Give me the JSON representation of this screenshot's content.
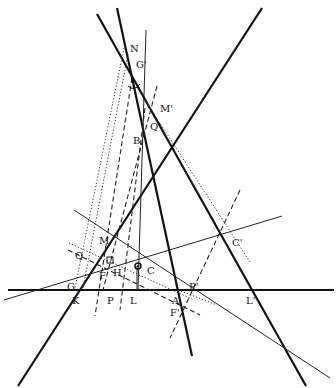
{
  "diagram": {
    "kind": "projective geometry construction",
    "points": [
      {
        "id": "N",
        "label": "N",
        "x": 127,
        "y": 48,
        "lx": 130,
        "ly": 48
      },
      {
        "id": "Gp",
        "label": "G'",
        "x": 134,
        "y": 78,
        "lx": 136,
        "ly": 64
      },
      {
        "id": "Mp",
        "label": "M'",
        "x": 156,
        "y": 105,
        "lx": 160,
        "ly": 108
      },
      {
        "id": "Qp",
        "label": "Q'",
        "x": 145,
        "y": 116,
        "lx": 150,
        "ly": 126
      },
      {
        "id": "B",
        "label": "B",
        "x": 144,
        "y": 138,
        "lx": 133,
        "ly": 140
      },
      {
        "id": "M",
        "label": "M",
        "x": 96,
        "y": 237,
        "lx": 99,
        "ly": 240
      },
      {
        "id": "Q",
        "label": "Q",
        "x": 88,
        "y": 256,
        "lx": 75,
        "ly": 255
      },
      {
        "id": "H",
        "label": "H",
        "x": 112,
        "y": 261,
        "lx": 113,
        "ly": 272
      },
      {
        "id": "C",
        "label": "C",
        "x": 138,
        "y": 266,
        "lx": 147,
        "ly": 270
      },
      {
        "id": "F",
        "label": "F",
        "x": 107,
        "y": 278,
        "lx": 99,
        "ly": 275
      },
      {
        "id": "G",
        "label": "G",
        "x": 78,
        "y": 281,
        "lx": 67,
        "ly": 286
      },
      {
        "id": "Cp",
        "label": "C'",
        "x": 228,
        "y": 236,
        "lx": 232,
        "ly": 242
      },
      {
        "id": "K",
        "label": "K",
        "x": 71,
        "y": 290,
        "lx": 72,
        "ly": 300
      },
      {
        "id": "P",
        "label": "P",
        "x": 107,
        "y": 290,
        "lx": 107,
        "ly": 300
      },
      {
        "id": "L",
        "label": "L",
        "x": 137,
        "y": 290,
        "lx": 130,
        "ly": 300
      },
      {
        "id": "A",
        "label": "A",
        "x": 178,
        "y": 290,
        "lx": 172,
        "ly": 300
      },
      {
        "id": "Pp",
        "label": "P'",
        "x": 190,
        "y": 286,
        "lx": 189,
        "ly": 286
      },
      {
        "id": "Fp",
        "label": "F'",
        "x": 181,
        "y": 307,
        "lx": 170,
        "ly": 312
      },
      {
        "id": "Lp",
        "label": "L'",
        "x": 256,
        "y": 290,
        "lx": 246,
        "ly": 300
      }
    ],
    "lines": {
      "thick": [
        {
          "x1": 117,
          "y1": 8,
          "x2": 192,
          "y2": 356
        },
        {
          "x1": 97,
          "y1": 14,
          "x2": 306,
          "y2": 386
        },
        {
          "x1": 262,
          "y1": 8,
          "x2": 18,
          "y2": 386
        },
        {
          "x1": 8,
          "y1": 290,
          "x2": 334,
          "y2": 290
        }
      ],
      "thin": [
        {
          "x1": 146,
          "y1": 30,
          "x2": 138,
          "y2": 290
        },
        {
          "x1": 4,
          "y1": 300,
          "x2": 282,
          "y2": 216
        },
        {
          "x1": 74,
          "y1": 210,
          "x2": 330,
          "y2": 378
        },
        {
          "x1": 137,
          "y1": 266,
          "x2": 137,
          "y2": 290
        }
      ],
      "dashed": [
        {
          "x1": 132,
          "y1": 78,
          "x2": 95,
          "y2": 316
        },
        {
          "x1": 145,
          "y1": 108,
          "x2": 120,
          "y2": 310
        },
        {
          "x1": 240,
          "y1": 190,
          "x2": 170,
          "y2": 338
        },
        {
          "x1": 68,
          "y1": 250,
          "x2": 200,
          "y2": 315
        },
        {
          "x1": 157,
          "y1": 86,
          "x2": 103,
          "y2": 290
        }
      ],
      "dotted": [
        {
          "x1": 124,
          "y1": 48,
          "x2": 75,
          "y2": 288
        },
        {
          "x1": 128,
          "y1": 54,
          "x2": 83,
          "y2": 288
        },
        {
          "x1": 69,
          "y1": 243,
          "x2": 194,
          "y2": 300
        },
        {
          "x1": 145,
          "y1": 100,
          "x2": 250,
          "y2": 262
        },
        {
          "x1": 178,
          "y1": 290,
          "x2": 217,
          "y2": 305
        }
      ]
    },
    "right_angle_mark": {
      "x": 107,
      "y": 257,
      "size": 6
    },
    "center_point": {
      "x": 138,
      "y": 266,
      "r": 3
    }
  }
}
